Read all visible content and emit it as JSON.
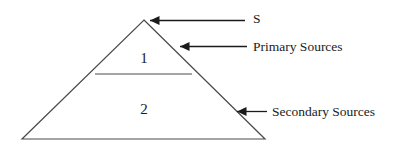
{
  "figure": {
    "type": "pyramid-diagram",
    "background_color": "#ffffff",
    "line_color": "#4a4a4a",
    "arrow_color": "#1b1b1b",
    "text_color": "#1b1b1b",
    "apex_label": "S",
    "tiers": [
      {
        "number": "1",
        "name": "Primary Sources"
      },
      {
        "number": "2",
        "name": "Secondary Sources"
      }
    ],
    "callouts": [
      {
        "label": "S",
        "target": "apex"
      },
      {
        "label": "Primary Sources",
        "target": "tier-1"
      },
      {
        "label": "Secondary Sources",
        "target": "tier-2"
      }
    ]
  }
}
